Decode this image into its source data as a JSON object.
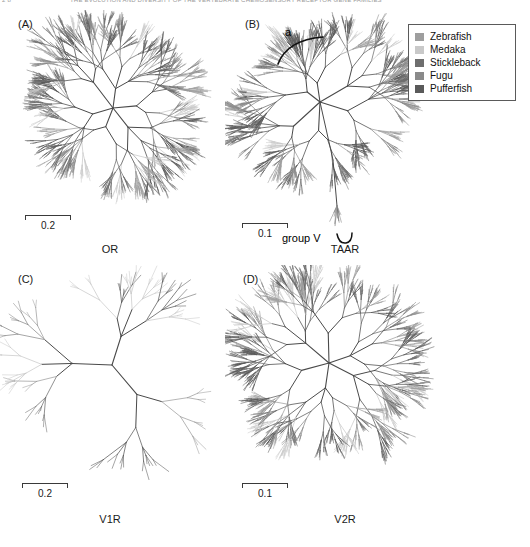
{
  "running_head": {
    "left": "2 8",
    "right": "THE EVOLUTION AND DIVERSITY OF THE VERTEBRATE CHEMOSENSORY RECEPTOR GENE FAMILIES"
  },
  "figure": {
    "width": 530,
    "height": 547
  },
  "legend": {
    "title": "",
    "position": "top-right",
    "items": [
      {
        "label": "Zebrafish",
        "color": "#9e9e9e"
      },
      {
        "label": "Medaka",
        "color": "#c9c9c9"
      },
      {
        "label": "Stickleback",
        "color": "#6e6e6e"
      },
      {
        "label": "Fugu",
        "color": "#8a8a8a"
      },
      {
        "label": "Pufferfish",
        "color": "#5a5a5a"
      }
    ]
  },
  "panels": [
    {
      "id": "A",
      "label": "(A)",
      "title": "OR",
      "scalebar": {
        "value": "0.2",
        "length_px": 46
      },
      "tree": {
        "type": "unrooted-radial",
        "density": "very-high",
        "tip_count": 290,
        "seed": 1307,
        "center_x": 113,
        "center_y": 105,
        "radius": 96,
        "backbone_spread": 2.9,
        "annotations": []
      }
    },
    {
      "id": "B",
      "label": "(B)",
      "title": "TAAR",
      "scalebar": {
        "value": "0.1",
        "length_px": 46
      },
      "tree": {
        "type": "unrooted-radial",
        "density": "high",
        "tip_count": 190,
        "seed": 8821,
        "center_x": 318,
        "center_y": 108,
        "radius": 92,
        "backbone_spread": 3.2,
        "annotations": [
          {
            "name": "clade-a",
            "text": "a"
          },
          {
            "name": "group-v",
            "text": "group V"
          }
        ]
      }
    },
    {
      "id": "C",
      "label": "(C)",
      "title": "V1R",
      "scalebar": {
        "value": "0.2",
        "length_px": 46
      },
      "tree": {
        "type": "unrooted-radial",
        "density": "low",
        "tip_count": 34,
        "seed": 415,
        "center_x": 118,
        "center_y": 382,
        "radius": 92,
        "backbone_spread": 1.0,
        "annotations": []
      }
    },
    {
      "id": "D",
      "label": "(D)",
      "title": "V2R",
      "scalebar": {
        "value": "0.1",
        "length_px": 46
      },
      "tree": {
        "type": "unrooted-radial",
        "density": "medium-high",
        "tip_count": 150,
        "seed": 9052,
        "center_x": 322,
        "center_y": 382,
        "radius": 92,
        "backbone_spread": 2.4,
        "annotations": []
      }
    }
  ],
  "chart_data": {
    "type": "tree",
    "title": "",
    "subtitle": "",
    "panel_titles": [
      "OR",
      "TAAR",
      "V1R",
      "V2R"
    ],
    "panel_labels": [
      "(A)",
      "(B)",
      "(C)",
      "(D)"
    ],
    "scale_values": [
      "0.2",
      "0.1",
      "0.2",
      "0.1"
    ],
    "legend_entries": [
      "Zebrafish",
      "Medaka",
      "Stickleback",
      "Fugu",
      "Pufferfish"
    ],
    "annotations": [
      "a",
      "group V"
    ]
  }
}
